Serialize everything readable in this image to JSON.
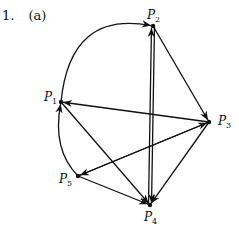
{
  "heading": {
    "number": "1.",
    "part": "(a)"
  },
  "graph": {
    "nodes": [
      {
        "id": "P1",
        "label": "P",
        "sub": "1",
        "x": 61,
        "y": 102,
        "lx": 44,
        "ly": 90
      },
      {
        "id": "P2",
        "label": "P",
        "sub": "2",
        "x": 153,
        "y": 26,
        "lx": 147,
        "ly": 8
      },
      {
        "id": "P3",
        "label": "P",
        "sub": "3",
        "x": 209,
        "y": 122,
        "lx": 218,
        "ly": 114
      },
      {
        "id": "P4",
        "label": "P",
        "sub": "4",
        "x": 150,
        "y": 205,
        "lx": 144,
        "ly": 210
      },
      {
        "id": "P5",
        "label": "P",
        "sub": "5",
        "x": 78,
        "y": 176,
        "lx": 59,
        "ly": 172
      }
    ],
    "edges": [
      {
        "from": "P1",
        "to": "P2",
        "curved": true
      },
      {
        "from": "P4",
        "to": "P2",
        "curved": false
      },
      {
        "from": "P2",
        "to": "P4",
        "curved": false
      },
      {
        "from": "P2",
        "to": "P3",
        "curved": false
      },
      {
        "from": "P3",
        "to": "P1",
        "curved": false
      },
      {
        "from": "P3",
        "to": "P5",
        "curved": false
      },
      {
        "from": "P5",
        "to": "P3",
        "curved": false
      },
      {
        "from": "P1",
        "to": "P4",
        "curved": false
      },
      {
        "from": "P5",
        "to": "P4",
        "curved": false
      },
      {
        "from": "P3",
        "to": "P4",
        "curved": false
      },
      {
        "from": "P5",
        "to": "P1",
        "curved": true
      }
    ]
  }
}
